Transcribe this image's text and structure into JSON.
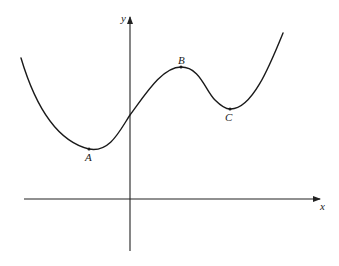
{
  "diagram": {
    "type": "function-graph",
    "axes": {
      "x_label": "x",
      "y_label": "y",
      "origin_px": [
        130,
        199
      ],
      "x_axis": {
        "from_px": [
          24,
          199
        ],
        "to_px": [
          320,
          199
        ],
        "arrow": true
      },
      "y_axis": {
        "from_px": [
          130,
          251
        ],
        "to_px": [
          130,
          17
        ],
        "arrow": true
      }
    },
    "points": [
      {
        "label": "A",
        "role": "local minimum",
        "px": [
          89,
          149
        ],
        "label_px": [
          88,
          158
        ]
      },
      {
        "label": "B",
        "role": "local maximum",
        "px": [
          181,
          67
        ],
        "label_px": [
          182,
          61
        ]
      },
      {
        "label": "C",
        "role": "local minimum",
        "px": [
          230,
          109
        ],
        "label_px": [
          228,
          118
        ]
      }
    ],
    "curve": {
      "start_px": [
        21,
        58
      ],
      "y_intercept_px": [
        130,
        115
      ],
      "end_px": [
        283,
        33
      ]
    },
    "colors": {
      "line": "#1a1a1a",
      "background": "#ffffff"
    }
  }
}
